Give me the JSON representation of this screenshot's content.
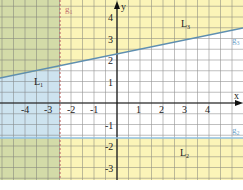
{
  "chart_data": {
    "type": "diagram",
    "title": "",
    "axes": {
      "x_label": "x",
      "y_label": "y",
      "x_ticks": [
        "-4",
        "-3",
        "-2",
        "-1",
        "1",
        "2",
        "3",
        "4"
      ],
      "y_ticks": [
        "4",
        "3",
        "2",
        "1",
        "-1",
        "-2",
        "-3"
      ],
      "xlim": [
        -5,
        5.5
      ],
      "ylim": [
        -4,
        4.8
      ]
    },
    "lines": [
      {
        "name": "g1",
        "type": "vertical",
        "x": -2.5,
        "style": "dashed",
        "color": "#c07070"
      },
      {
        "name": "g2",
        "type": "horizontal",
        "y": -1.5,
        "style": "solid",
        "color": "#7aaed6"
      },
      {
        "name": "g3",
        "type": "line",
        "slope": 0.25,
        "intercept": 2.6,
        "style": "solid",
        "color": "#5f8fb0"
      }
    ],
    "regions": [
      {
        "name": "L1",
        "description": "left of g1 (x < -2.5), shaded blue below g3"
      },
      {
        "name": "L2",
        "description": "below g2 (y < -1.5), shaded yellow"
      },
      {
        "name": "L3",
        "description": "above g3, shaded yellow"
      }
    ],
    "colors": {
      "yellow": "#fbf4b8",
      "blue": "#cde3ef",
      "green": "#d3dba8",
      "grid": "#6f6f6f"
    }
  },
  "labels": {
    "x_axis": "x",
    "y_axis": "y",
    "g1": "g",
    "g1_sub": "1",
    "g2": "g",
    "g2_sub": "2",
    "g3": "g",
    "g3_sub": "3",
    "L1": "L",
    "L1_sub": "1",
    "L2": "L",
    "L2_sub": "2",
    "L3": "L",
    "L3_sub": "3",
    "x_ticks": [
      "-4",
      "-3",
      "-2",
      "-1",
      "1",
      "2",
      "3",
      "4"
    ],
    "y_ticks": [
      "4",
      "3",
      "2",
      "1",
      "-1",
      "-2",
      "-3"
    ]
  }
}
